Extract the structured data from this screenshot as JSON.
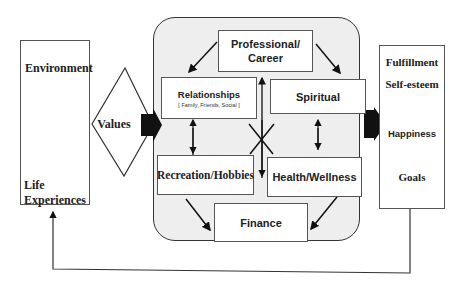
{
  "left_panel": {
    "environment": "Environment",
    "life_experiences_line1": "Life",
    "life_experiences_line2": "Experiences"
  },
  "values": {
    "label": "Values"
  },
  "center_panel": {
    "professional_line1": "Professional/",
    "professional_line2": "Career",
    "relationships": "Relationships",
    "relationships_sub": "[ Family, Friends, Social ]",
    "spiritual": "Spiritual",
    "recreation": "Recreation/Hobbies",
    "health": "Health/Wellness",
    "finance": "Finance"
  },
  "right_panel": {
    "items": [
      "Fulfillment",
      "Self-esteem",
      "Happiness",
      "Goals"
    ]
  },
  "colors": {
    "center_bg": "#eeeeee",
    "border": "#555555",
    "arrow": "#111111"
  }
}
